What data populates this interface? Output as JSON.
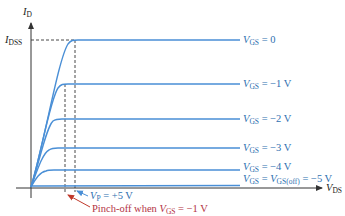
{
  "diagram": {
    "axes": {
      "y_label_main": "I",
      "y_label_sub": "D",
      "x_label_main": "V",
      "x_label_sub": "DS",
      "idss_main": "I",
      "idss_sub": "DSS"
    },
    "curves": [
      {
        "vgs_main": "V",
        "vgs_sub": "GS",
        "value": " = 0"
      },
      {
        "vgs_main": "V",
        "vgs_sub": "GS",
        "value": " = −1 V"
      },
      {
        "vgs_main": "V",
        "vgs_sub": "GS",
        "value": " = −2 V"
      },
      {
        "vgs_main": "V",
        "vgs_sub": "GS",
        "value": " = −3 V"
      },
      {
        "vgs_main": "V",
        "vgs_sub": "GS",
        "value": " = −4 V"
      },
      {
        "vgs_main": "V",
        "vgs_sub": "GS",
        "value": " = ",
        "off_main": "V",
        "off_sub": "GS(off)",
        "off_value": " = −5 V"
      }
    ],
    "annotations": {
      "vp_main": "V",
      "vp_sub": "P",
      "vp_value": " = +5 V",
      "pinch_text": "Pinch-off when ",
      "pinch_main": "V",
      "pinch_sub": "GS",
      "pinch_value": " = −1 V"
    },
    "colors": {
      "curve": "#4a8fd6",
      "axis": "#333333",
      "label_blue": "#2e6fb0",
      "label_red": "#b3323f",
      "arrow_red": "#c0392b"
    }
  }
}
